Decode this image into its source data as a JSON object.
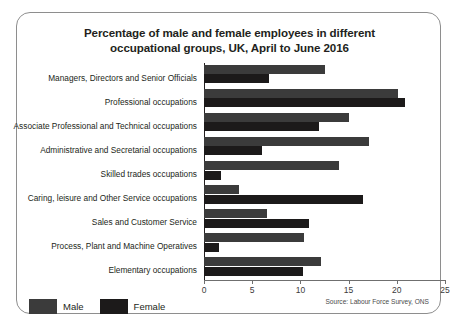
{
  "chart_data": {
    "type": "bar",
    "orientation": "horizontal",
    "title": "Percentage of male and female employees in different occupational groups, UK, April to June 2016",
    "title_line1": "Percentage of male and female employees in different",
    "title_line2": "occupational groups, UK, April to June 2016",
    "xlabel": "",
    "ylabel": "",
    "xlim": [
      0,
      25
    ],
    "xticks": [
      0,
      5,
      10,
      15,
      20,
      25
    ],
    "xtick_labels": [
      "0",
      "5",
      "10",
      "15",
      "20",
      "25"
    ],
    "grid": false,
    "legend_position": "bottom-left",
    "categories": [
      "Managers, Directors and Senior Officials",
      "Professional occupations",
      "Associate Professional and Technical occupations",
      "Administrative and Secretarial occupations",
      "Skilled trades occupations",
      "Caring, leisure and Other Service occupations",
      "Sales and Customer Service",
      "Process, Plant and  Machine Operatives",
      "Elementary occupations"
    ],
    "series": [
      {
        "name": "Male",
        "color": "#3b3b3b",
        "values": [
          12.5,
          20.1,
          15.0,
          17.1,
          14.0,
          3.6,
          6.5,
          10.4,
          12.1
        ]
      },
      {
        "name": "Female",
        "color": "#1c1a1a",
        "values": [
          6.7,
          20.8,
          11.9,
          6.0,
          1.8,
          16.5,
          10.9,
          1.6,
          10.3
        ]
      }
    ],
    "source": "Source: Labour Force Survey, ONS"
  },
  "legend": {
    "male_label": "Male",
    "female_label": "Female"
  }
}
